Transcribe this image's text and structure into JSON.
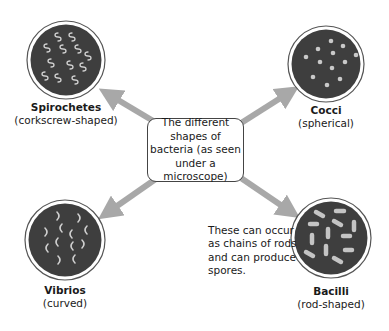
{
  "center": {
    "text": "The different shapes of bacteria (as seen under a microscope)"
  },
  "bacteria": [
    {
      "name": "Spirochetes",
      "description": "(corkscrew-shaped)",
      "icon": "spirochetes-icon"
    },
    {
      "name": "Cocci",
      "description": "(spherical)",
      "icon": "cocci-icon"
    },
    {
      "name": "Vibrios",
      "description": "(curved)",
      "icon": "vibrios-icon"
    },
    {
      "name": "Bacilli",
      "description": "(rod-shaped)",
      "icon": "bacilli-icon"
    }
  ],
  "note": {
    "text": "These can occur as chains of rods and can produce spores."
  },
  "colors": {
    "arrow": "#a8a8a8",
    "circle_fill": "#3e3e3e",
    "circle_ring": "#555555",
    "organism": "#c9c9c9"
  }
}
